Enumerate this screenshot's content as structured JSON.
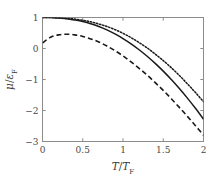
{
  "chart_data": {
    "type": "line",
    "title": "",
    "xlabel": "T/T_F",
    "ylabel": "mu/eps_F",
    "xlabel_parts": {
      "num": "T",
      "den": "T",
      "den_sub": "F"
    },
    "ylabel_parts": {
      "num": "μ",
      "den": "ε",
      "den_sub": "F"
    },
    "xlim": [
      0,
      2
    ],
    "ylim": [
      -3,
      1
    ],
    "xticks": [
      0,
      0.5,
      1,
      1.5,
      2
    ],
    "xtick_labels": [
      "0",
      "0.5",
      "1",
      "1.5",
      "2"
    ],
    "yticks": [
      1,
      0,
      -1,
      -2,
      -3
    ],
    "ytick_labels": [
      "1",
      "0",
      "−1",
      "−2",
      "−3"
    ],
    "grid": false,
    "legend": "none",
    "frame": "box",
    "line_color": "#1a1a1a",
    "frame_color": "#8c8c8c",
    "series": [
      {
        "name": "dotted",
        "style": "dotted",
        "x": [
          0,
          0.1,
          0.2,
          0.3,
          0.4,
          0.5,
          0.6,
          0.7,
          0.8,
          0.9,
          1.0,
          1.1,
          1.2,
          1.3,
          1.4,
          1.5,
          1.6,
          1.7,
          1.8,
          1.9,
          2.0
        ],
        "values": [
          1.0,
          1.0,
          0.99,
          0.97,
          0.95,
          0.91,
          0.86,
          0.79,
          0.71,
          0.61,
          0.49,
          0.35,
          0.19,
          0.02,
          -0.18,
          -0.39,
          -0.62,
          -0.87,
          -1.14,
          -1.42,
          -1.72
        ]
      },
      {
        "name": "solid",
        "style": "solid",
        "x": [
          0,
          0.1,
          0.2,
          0.3,
          0.4,
          0.5,
          0.6,
          0.7,
          0.8,
          0.9,
          1.0,
          1.1,
          1.2,
          1.3,
          1.4,
          1.5,
          1.6,
          1.7,
          1.8,
          1.9,
          2.0
        ],
        "values": [
          1.0,
          1.0,
          0.98,
          0.96,
          0.92,
          0.87,
          0.8,
          0.71,
          0.6,
          0.47,
          0.32,
          0.15,
          -0.04,
          -0.25,
          -0.48,
          -0.73,
          -1.0,
          -1.29,
          -1.6,
          -1.93,
          -2.28
        ]
      },
      {
        "name": "dashed",
        "style": "dashed",
        "x": [
          0,
          0.1,
          0.2,
          0.3,
          0.4,
          0.5,
          0.6,
          0.7,
          0.8,
          0.9,
          1.0,
          1.1,
          1.2,
          1.3,
          1.4,
          1.5,
          1.6,
          1.7,
          1.8,
          1.9,
          2.0
        ],
        "values": [
          0.18,
          0.36,
          0.44,
          0.46,
          0.44,
          0.39,
          0.31,
          0.21,
          0.08,
          -0.07,
          -0.24,
          -0.43,
          -0.64,
          -0.86,
          -1.1,
          -1.35,
          -1.62,
          -1.9,
          -2.19,
          -2.49,
          -2.8
        ]
      }
    ]
  }
}
